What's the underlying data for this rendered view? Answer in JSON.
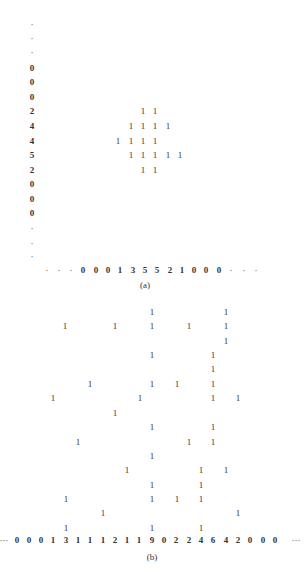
{
  "panel_a": {
    "caption": "(a)",
    "left_column": {
      "x": 32,
      "entries": [
        {
          "y": 24,
          "text": "·"
        },
        {
          "y": 38,
          "text": "·"
        },
        {
          "y": 52,
          "text": "·"
        },
        {
          "y": 68,
          "text": "0"
        },
        {
          "y": 82,
          "text": "0"
        },
        {
          "y": 97,
          "text": "0"
        },
        {
          "y": 111,
          "text": "2"
        },
        {
          "y": 126,
          "text": "4"
        },
        {
          "y": 141,
          "text": "4"
        },
        {
          "y": 155,
          "text": "5"
        },
        {
          "y": 170,
          "text": "2"
        },
        {
          "y": 184,
          "text": "0"
        },
        {
          "y": 199,
          "text": "0"
        },
        {
          "y": 213,
          "text": "0"
        },
        {
          "y": 228,
          "text": "·"
        },
        {
          "y": 243,
          "text": "·"
        },
        {
          "y": 256,
          "text": "·"
        }
      ]
    },
    "bottom_row": {
      "y": 270,
      "entries": [
        {
          "x": 47,
          "text": "·"
        },
        {
          "x": 59,
          "text": "·"
        },
        {
          "x": 71,
          "text": "·"
        },
        {
          "x": 83,
          "text": "0"
        },
        {
          "x": 96,
          "text": "0"
        },
        {
          "x": 108,
          "text": "0"
        },
        {
          "x": 120,
          "text": "1"
        },
        {
          "x": 133,
          "text": "3"
        },
        {
          "x": 145,
          "text": "5"
        },
        {
          "x": 157,
          "text": "5"
        },
        {
          "x": 170,
          "text": "2"
        },
        {
          "x": 182,
          "text": "1"
        },
        {
          "x": 194,
          "text": "0"
        },
        {
          "x": 206,
          "text": "0"
        },
        {
          "x": 219,
          "text": "0"
        },
        {
          "x": 231,
          "text": "·"
        },
        {
          "x": 244,
          "text": "·"
        },
        {
          "x": 256,
          "text": "·"
        }
      ]
    },
    "cells": [
      {
        "x": 143,
        "y": 111
      },
      {
        "x": 155,
        "y": 111
      },
      {
        "x": 131,
        "y": 126
      },
      {
        "x": 143,
        "y": 126
      },
      {
        "x": 155,
        "y": 126
      },
      {
        "x": 168,
        "y": 126
      },
      {
        "x": 118,
        "y": 141
      },
      {
        "x": 131,
        "y": 141
      },
      {
        "x": 143,
        "y": 141
      },
      {
        "x": 155,
        "y": 141
      },
      {
        "x": 131,
        "y": 155
      },
      {
        "x": 143,
        "y": 155
      },
      {
        "x": 155,
        "y": 155
      },
      {
        "x": 168,
        "y": 155
      },
      {
        "x": 180,
        "y": 155
      },
      {
        "x": 143,
        "y": 170
      },
      {
        "x": 155,
        "y": 170
      }
    ],
    "cell_value": "1",
    "caption_pos": {
      "x": 145,
      "y": 285
    }
  },
  "panel_b": {
    "caption": "(b)",
    "bottom_row": {
      "y": 540,
      "entries": [
        {
          "x": 4,
          "text": "···"
        },
        {
          "x": 17,
          "text": "0"
        },
        {
          "x": 29,
          "text": "0"
        },
        {
          "x": 41,
          "text": "0"
        },
        {
          "x": 53,
          "text": "1"
        },
        {
          "x": 66,
          "text": "3"
        },
        {
          "x": 78,
          "text": "1"
        },
        {
          "x": 90,
          "text": "1"
        },
        {
          "x": 103,
          "text": "1"
        },
        {
          "x": 115,
          "text": "2"
        },
        {
          "x": 127,
          "text": "1"
        },
        {
          "x": 139,
          "text": "1"
        },
        {
          "x": 152,
          "text": "9"
        },
        {
          "x": 164,
          "text": "0"
        },
        {
          "x": 176,
          "text": "2"
        },
        {
          "x": 189,
          "text": "2"
        },
        {
          "x": 201,
          "text": "4"
        },
        {
          "x": 213,
          "text": "6"
        },
        {
          "x": 226,
          "text": "4"
        },
        {
          "x": 238,
          "text": "2"
        },
        {
          "x": 250,
          "text": "0"
        },
        {
          "x": 263,
          "text": "0"
        },
        {
          "x": 275,
          "text": "0"
        },
        {
          "x": 296,
          "text": "···"
        }
      ]
    },
    "cells": [
      {
        "x": 152,
        "y": 312
      },
      {
        "x": 226,
        "y": 312
      },
      {
        "x": 65,
        "y": 326
      },
      {
        "x": 115,
        "y": 326
      },
      {
        "x": 152,
        "y": 326
      },
      {
        "x": 189,
        "y": 326
      },
      {
        "x": 226,
        "y": 326
      },
      {
        "x": 226,
        "y": 341
      },
      {
        "x": 152,
        "y": 355
      },
      {
        "x": 213,
        "y": 355
      },
      {
        "x": 213,
        "y": 369
      },
      {
        "x": 90,
        "y": 384
      },
      {
        "x": 152,
        "y": 384
      },
      {
        "x": 177,
        "y": 384
      },
      {
        "x": 213,
        "y": 384
      },
      {
        "x": 53,
        "y": 398
      },
      {
        "x": 140,
        "y": 398
      },
      {
        "x": 213,
        "y": 398
      },
      {
        "x": 238,
        "y": 398
      },
      {
        "x": 115,
        "y": 413
      },
      {
        "x": 152,
        "y": 427
      },
      {
        "x": 213,
        "y": 427
      },
      {
        "x": 78,
        "y": 442
      },
      {
        "x": 189,
        "y": 442
      },
      {
        "x": 213,
        "y": 442
      },
      {
        "x": 152,
        "y": 456
      },
      {
        "x": 127,
        "y": 470
      },
      {
        "x": 201,
        "y": 470
      },
      {
        "x": 226,
        "y": 470
      },
      {
        "x": 152,
        "y": 485
      },
      {
        "x": 201,
        "y": 485
      },
      {
        "x": 66,
        "y": 499
      },
      {
        "x": 152,
        "y": 499
      },
      {
        "x": 177,
        "y": 499
      },
      {
        "x": 201,
        "y": 499
      },
      {
        "x": 103,
        "y": 513
      },
      {
        "x": 238,
        "y": 513
      },
      {
        "x": 66,
        "y": 528
      },
      {
        "x": 152,
        "y": 528
      },
      {
        "x": 201,
        "y": 528
      }
    ],
    "cell_value": "1",
    "caption_pos": {
      "x": 152,
      "y": 557
    }
  }
}
